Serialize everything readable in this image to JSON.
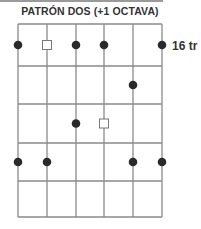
{
  "title": "PATRÓN DOS (+1 OCTAVA)",
  "fret_label": "16 tr",
  "colors": {
    "grid": "#8a8a8a",
    "dot": "#2a2a2a",
    "square_stroke": "#777777",
    "text": "#333333"
  },
  "grid": {
    "strings_x": [
      18,
      47,
      76,
      104,
      133,
      162
    ],
    "frets_y": [
      24,
      66,
      104,
      143,
      181,
      217
    ]
  },
  "markers": [
    {
      "fret": 1,
      "string": 1,
      "type": "dot"
    },
    {
      "fret": 1,
      "string": 2,
      "type": "square"
    },
    {
      "fret": 1,
      "string": 3,
      "type": "dot"
    },
    {
      "fret": 1,
      "string": 4,
      "type": "dot"
    },
    {
      "fret": 1,
      "string": 6,
      "type": "dot"
    },
    {
      "fret": 2,
      "string": 5,
      "type": "dot"
    },
    {
      "fret": 3,
      "string": 3,
      "type": "dot"
    },
    {
      "fret": 3,
      "string": 4,
      "type": "square"
    },
    {
      "fret": 4,
      "string": 1,
      "type": "dot"
    },
    {
      "fret": 4,
      "string": 2,
      "type": "dot"
    },
    {
      "fret": 4,
      "string": 5,
      "type": "dot"
    },
    {
      "fret": 4,
      "string": 6,
      "type": "dot"
    }
  ]
}
